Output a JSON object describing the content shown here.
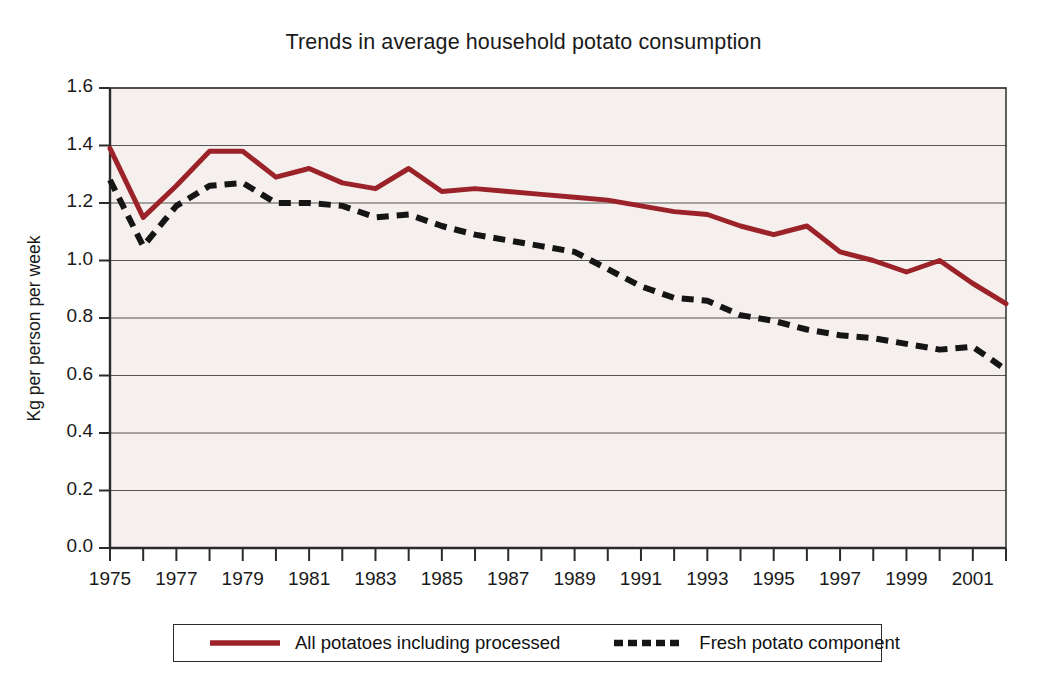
{
  "chart_data": {
    "type": "line",
    "title": "Trends in average household potato consumption",
    "xlabel": "",
    "ylabel": "Kg per person per week",
    "xlim": [
      1975,
      2002
    ],
    "ylim": [
      0.0,
      1.6
    ],
    "ytick_labels": [
      "1.6",
      "1.4",
      "1.2",
      "1.0",
      "0.8",
      "0.6",
      "0.4",
      "0.2",
      "0.0"
    ],
    "ytick_values": [
      1.6,
      1.4,
      1.2,
      1.0,
      0.8,
      0.6,
      0.4,
      0.2,
      0.0
    ],
    "xtick_values": [
      1975,
      1976,
      1977,
      1978,
      1979,
      1980,
      1981,
      1982,
      1983,
      1984,
      1985,
      1986,
      1987,
      1988,
      1989,
      1990,
      1991,
      1992,
      1993,
      1994,
      1995,
      1996,
      1997,
      1998,
      1999,
      2000,
      2001,
      2002
    ],
    "xtick_labels_shown": [
      "1975",
      "1977",
      "1979",
      "1981",
      "1983",
      "1985",
      "1987",
      "1989",
      "1991",
      "1993",
      "1995",
      "1997",
      "1999",
      "2001"
    ],
    "grid": "horizontal",
    "legend_position": "below-axes",
    "x": [
      1975,
      1976,
      1977,
      1978,
      1979,
      1980,
      1981,
      1982,
      1983,
      1984,
      1985,
      1986,
      1987,
      1988,
      1989,
      1990,
      1991,
      1992,
      1993,
      1994,
      1995,
      1996,
      1997,
      1998,
      1999,
      2000,
      2001,
      2002
    ],
    "series": [
      {
        "name": "All potatoes including processed",
        "style": "solid",
        "color": "#9B2229",
        "values": [
          1.39,
          1.15,
          1.26,
          1.38,
          1.38,
          1.29,
          1.32,
          1.27,
          1.25,
          1.32,
          1.24,
          1.25,
          1.24,
          1.23,
          1.22,
          1.21,
          1.19,
          1.17,
          1.16,
          1.12,
          1.09,
          1.12,
          1.03,
          1.0,
          0.96,
          1.0,
          0.92,
          0.85
        ]
      },
      {
        "name": "Fresh potato component",
        "style": "dashed",
        "color": "#151515",
        "values": [
          1.28,
          1.05,
          1.19,
          1.26,
          1.27,
          1.2,
          1.2,
          1.19,
          1.15,
          1.16,
          1.12,
          1.09,
          1.07,
          1.05,
          1.03,
          0.97,
          0.91,
          0.87,
          0.86,
          0.81,
          0.79,
          0.76,
          0.74,
          0.73,
          0.71,
          0.69,
          0.7,
          0.62
        ]
      }
    ]
  },
  "legend": {
    "items": [
      {
        "label": "All potatoes including processed",
        "style": "solid",
        "color": "#9B2229"
      },
      {
        "label": "Fresh potato component",
        "style": "dashed",
        "color": "#151515"
      }
    ]
  }
}
